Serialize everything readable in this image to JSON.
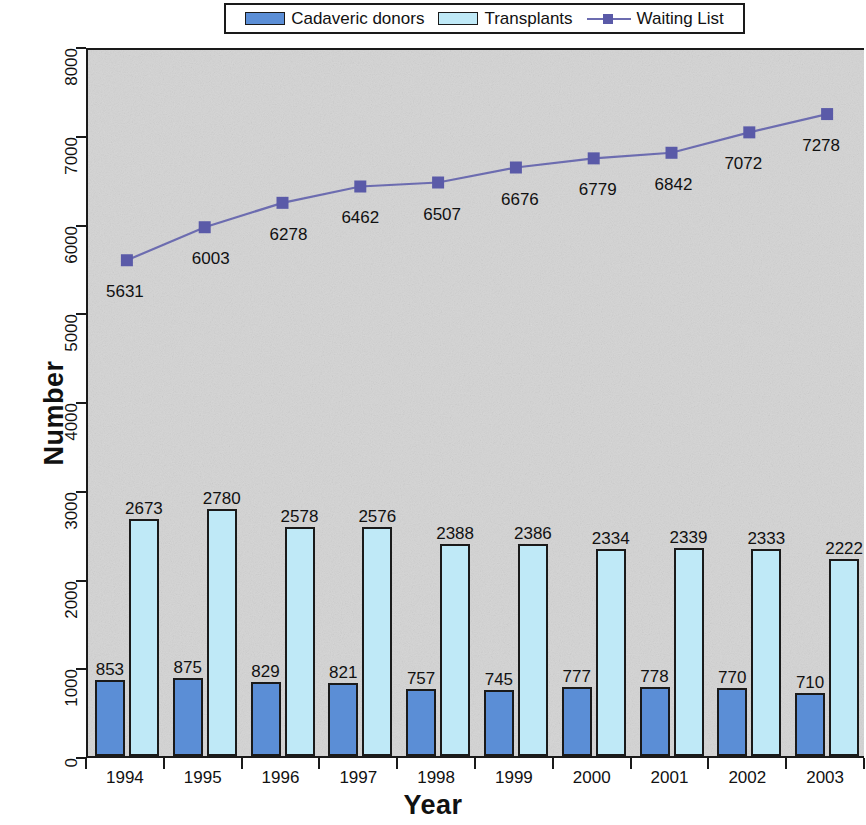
{
  "chart_data": {
    "type": "bar",
    "title": "",
    "xlabel": "Year",
    "ylabel": "Number",
    "categories": [
      "1994",
      "1995",
      "1996",
      "1997",
      "1998",
      "1999",
      "2000",
      "2001",
      "2002",
      "2003"
    ],
    "ylim": [
      0,
      8000
    ],
    "yticks": [
      0,
      1000,
      2000,
      3000,
      4000,
      5000,
      6000,
      7000,
      8000
    ],
    "ytick_labels": [
      "0",
      "1000",
      "2000",
      "3000",
      "4000",
      "5000",
      "6000",
      "7000",
      "8000"
    ],
    "grid": false,
    "legend_position": "top-center",
    "series": [
      {
        "name": "Cadaveric donors",
        "type": "bar",
        "color": "#5b8ed6",
        "values": [
          853,
          875,
          829,
          821,
          757,
          745,
          777,
          778,
          770,
          710
        ],
        "labels": [
          "853",
          "875",
          "829",
          "821",
          "757",
          "745",
          "777",
          "778",
          "770",
          "710"
        ]
      },
      {
        "name": "Transplants",
        "type": "bar",
        "color": "#bfe9f7",
        "values": [
          2673,
          2780,
          2578,
          2576,
          2388,
          2386,
          2334,
          2339,
          2333,
          2222
        ],
        "labels": [
          "2673",
          "2780",
          "2578",
          "2576",
          "2388",
          "2386",
          "2334",
          "2339",
          "2333",
          "2222"
        ]
      },
      {
        "name": "Waiting List",
        "type": "line",
        "color": "#6c6cb0",
        "marker_color": "#5a5aa8",
        "values": [
          5631,
          6003,
          6278,
          6462,
          6507,
          6676,
          6779,
          6842,
          7072,
          7278
        ],
        "labels": [
          "5631",
          "6003",
          "6278",
          "6462",
          "6507",
          "6676",
          "6779",
          "6842",
          "7072",
          "7278"
        ]
      }
    ]
  },
  "legend": {
    "items": [
      {
        "label": "Cadaveric donors",
        "marker": "bar-swatch",
        "color": "#5b8ed6"
      },
      {
        "label": "Transplants",
        "marker": "bar-swatch",
        "color": "#bfe9f7"
      },
      {
        "label": "Waiting List",
        "marker": "line-square-marker",
        "color": "#6c6cb0"
      }
    ]
  },
  "axes": {
    "y_title": "Number",
    "x_title": "Year"
  },
  "colors": {
    "plot_background": "#d4d4d4",
    "axis": "#1a1a1a",
    "donors": "#5b8ed6",
    "transplants": "#bfe9f7",
    "waiting_list": "#6c6cb0"
  }
}
